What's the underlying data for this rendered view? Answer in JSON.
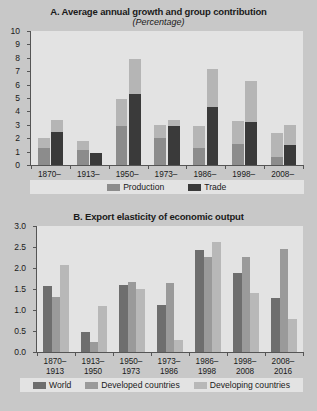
{
  "figure": {
    "background_color": "#c8c8c8",
    "plot_background_color": "#e3e3e3"
  },
  "chart_data": [
    {
      "type": "bar",
      "id": "panel-a",
      "title": "A. Average annual growth and group contribution",
      "subtitle": "(Percentage)",
      "xlabel": "",
      "ylabel": "",
      "ylim": [
        0,
        10
      ],
      "yticks": [
        "0",
        "1",
        "2",
        "3",
        "4",
        "5",
        "6",
        "7",
        "8",
        "9",
        "10"
      ],
      "grid": false,
      "stacked": true,
      "legend_position": "bottom",
      "legend": [
        "Production",
        "Trade"
      ],
      "colors": {
        "production": "#8c8c8c",
        "trade": "#3a3a3a",
        "upper_segment": "#b5b5b5"
      },
      "categories": [
        "1870–\n1913",
        "1913–\n1950",
        "1950–\n1973",
        "1973–\n1986",
        "1986–\n1998",
        "1998–\n2008",
        "2008–\n2016"
      ],
      "category_labels_line1": [
        "1870–",
        "1913–",
        "1950–",
        "1973–",
        "1986–",
        "1998–",
        "2008–"
      ],
      "category_labels_line2": [
        "1913",
        "1950",
        "1973",
        "1986",
        "1998",
        "2008",
        "2016"
      ],
      "series": [
        {
          "name": "Production",
          "base_values": [
            1.3,
            1.1,
            2.9,
            2.0,
            1.3,
            1.6,
            0.6
          ],
          "top_values": [
            0.7,
            0.7,
            2.0,
            1.0,
            1.6,
            1.7,
            1.8
          ],
          "totals": [
            2.0,
            1.8,
            4.9,
            3.0,
            2.9,
            3.3,
            2.4
          ]
        },
        {
          "name": "Trade",
          "base_values": [
            2.5,
            0.9,
            5.3,
            2.9,
            4.3,
            3.2,
            1.5
          ],
          "top_values": [
            0.85,
            0.0,
            2.6,
            0.45,
            2.9,
            3.1,
            1.5
          ],
          "totals": [
            3.35,
            0.9,
            7.9,
            3.35,
            7.2,
            6.3,
            3.0
          ]
        }
      ]
    },
    {
      "type": "bar",
      "id": "panel-b",
      "title": "B. Export elasticity of economic output",
      "subtitle": "",
      "xlabel": "",
      "ylabel": "",
      "ylim": [
        0,
        3.0
      ],
      "yticks": [
        "0.0",
        "0.5",
        "1.0",
        "1.5",
        "2.0",
        "2.5",
        "3.0"
      ],
      "grid": false,
      "stacked": false,
      "legend_position": "bottom",
      "legend": [
        "World",
        "Developed countries",
        "Developing countries"
      ],
      "colors": {
        "world": "#6e6e6e",
        "developed": "#9a9a9a",
        "developing": "#b8b8b8"
      },
      "categories": [
        "1870–1913",
        "1913–1950",
        "1950–1973",
        "1973–1986",
        "1986–1998",
        "1998–2008",
        "2008–2016"
      ],
      "category_labels_line1": [
        "1870–",
        "1913–",
        "1950–",
        "1973–",
        "1986–",
        "1998–",
        "2008–"
      ],
      "category_labels_line2": [
        "1913",
        "1950",
        "1973",
        "1986",
        "1998",
        "2008",
        "2016"
      ],
      "series": [
        {
          "name": "World",
          "values": [
            1.58,
            0.48,
            1.59,
            1.12,
            2.43,
            1.87,
            1.28
          ]
        },
        {
          "name": "Developed countries",
          "values": [
            1.3,
            0.23,
            1.66,
            1.65,
            2.26,
            2.27,
            2.45
          ]
        },
        {
          "name": "Developing countries",
          "values": [
            2.07,
            1.09,
            1.49,
            0.29,
            2.63,
            1.4,
            0.78
          ]
        }
      ]
    }
  ]
}
